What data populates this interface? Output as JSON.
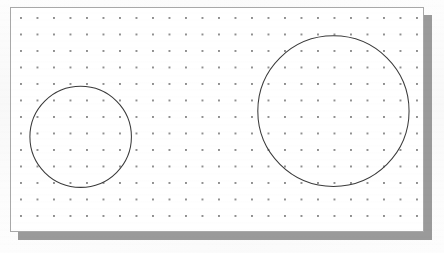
{
  "app": {
    "title": "Drawing Canvas",
    "background_color": "#fdfdfd"
  },
  "canvas": {
    "name": "dot-grid-drawing-area",
    "width": 414,
    "height": 225,
    "origin_x": 10,
    "origin_y": 7,
    "background_color": "#ffffff",
    "border_color": "#a8a8a8",
    "shadow_color": "#9a9a9a",
    "shadow_offset_x": 8,
    "shadow_offset_y": 8
  },
  "grid": {
    "name": "dot-grid",
    "style": "dots",
    "spacing_px": 16.5,
    "dot_color": "#6f6f6f",
    "dot_radius_px": 1,
    "columns": 25,
    "rows": 14,
    "visible": true
  },
  "shapes": [
    {
      "id": "circle-small",
      "name": "circle-left-small",
      "type": "circle",
      "cx": 80,
      "cy": 137,
      "r": 51,
      "stroke_color": "#3a3a3a",
      "stroke_width": 1,
      "fill": "none"
    },
    {
      "id": "circle-large",
      "name": "circle-right-large",
      "type": "circle",
      "cx": 334,
      "cy": 111,
      "r": 76,
      "stroke_color": "#3a3a3a",
      "stroke_width": 1,
      "fill": "none"
    }
  ]
}
